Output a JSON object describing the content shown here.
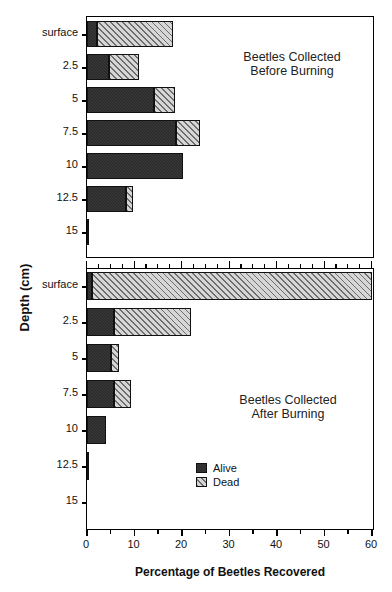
{
  "figure": {
    "xlabel": "Percentage of Beetles Recovered",
    "ylabel": "Depth (cm)"
  },
  "legend": {
    "items": [
      {
        "key": "alive",
        "label": "Alive"
      },
      {
        "key": "dead",
        "label": "Dead"
      }
    ]
  },
  "panels": [
    {
      "id": "before",
      "title_line1": "Beetles Collected",
      "title_line2": "Before Burning"
    },
    {
      "id": "after",
      "title_line1": "Beetles Collected",
      "title_line2": "After Burning"
    }
  ],
  "axis": {
    "x_ticks": [
      "0",
      "10",
      "20",
      "30",
      "40",
      "50",
      "60"
    ],
    "y_ticks": [
      "surface",
      "2.5",
      "5",
      "7.5",
      "10",
      "12.5",
      "15"
    ]
  },
  "colors": {
    "alive": "#3b3b3b",
    "dead": "#c9c9c9",
    "axis": "#000000",
    "background": "#ffffff"
  },
  "chart_data": {
    "type": "bar",
    "orientation": "horizontal",
    "xlabel": "Percentage of Beetles Recovered",
    "ylabel": "Depth (cm)",
    "xlim": [
      0,
      60
    ],
    "xticks": [
      0,
      10,
      20,
      30,
      40,
      50,
      60
    ],
    "grid": false,
    "legend_position": "inside-lower-center",
    "stacked": true,
    "categories": [
      "surface",
      "2.5",
      "5",
      "7.5",
      "10",
      "12.5",
      "15"
    ],
    "panels": [
      {
        "name": "Beetles Collected Before Burning",
        "series": [
          {
            "name": "Alive",
            "values": [
              2.0,
              4.6,
              14.2,
              18.8,
              20.3,
              8.2,
              0.3
            ]
          },
          {
            "name": "Dead",
            "values": [
              16.0,
              6.3,
              4.4,
              5.0,
              0.0,
              1.4,
              0.0
            ]
          }
        ],
        "totals": [
          18.0,
          10.9,
          18.6,
          23.8,
          20.3,
          9.6,
          0.3
        ]
      },
      {
        "name": "Beetles Collected After Burning",
        "series": [
          {
            "name": "Alive",
            "values": [
              1.0,
              5.6,
              5.0,
              5.6,
              4.0,
              0.4,
              0.0
            ]
          },
          {
            "name": "Dead",
            "values": [
              59.0,
              16.2,
              1.7,
              3.6,
              0.0,
              0.0,
              0.0
            ]
          }
        ],
        "totals": [
          60.0,
          21.8,
          6.7,
          9.2,
          4.0,
          0.4,
          0.0
        ]
      }
    ]
  }
}
